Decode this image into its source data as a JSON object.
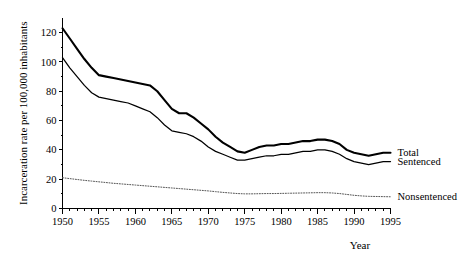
{
  "chart_data": {
    "type": "line",
    "title": "",
    "xlabel": "Year",
    "ylabel": "Incarceration rate per 100,000 inhabitants",
    "xlim": [
      1950,
      1995
    ],
    "ylim": [
      0,
      130
    ],
    "grid": false,
    "legend_position": "right-inline",
    "x_ticks_major": [
      1950,
      1955,
      1960,
      1965,
      1970,
      1975,
      1980,
      1985,
      1990,
      1995
    ],
    "x_tick_labels": [
      "1950",
      "1955",
      "1960",
      "1965",
      "1970",
      "1975",
      "1980",
      "1985",
      "1990",
      "1995"
    ],
    "x_ticks_minor_step": 1,
    "y_ticks": [
      0,
      20,
      40,
      60,
      80,
      100,
      120
    ],
    "y_tick_labels": [
      "0",
      "20",
      "40",
      "60",
      "80",
      "100",
      "120"
    ],
    "x": [
      1950,
      1951,
      1952,
      1953,
      1954,
      1955,
      1956,
      1957,
      1958,
      1959,
      1960,
      1961,
      1962,
      1963,
      1964,
      1965,
      1966,
      1967,
      1968,
      1969,
      1970,
      1971,
      1972,
      1973,
      1974,
      1975,
      1976,
      1977,
      1978,
      1979,
      1980,
      1981,
      1982,
      1983,
      1984,
      1985,
      1986,
      1987,
      1988,
      1989,
      1990,
      1991,
      1992,
      1993,
      1994,
      1995
    ],
    "series": [
      {
        "name": "Total",
        "label": "Total",
        "style": "solid-thick",
        "values": [
          123,
          116,
          109,
          102,
          96,
          91,
          90,
          89,
          88,
          87,
          86,
          85,
          84,
          80,
          74,
          68,
          65,
          65,
          62,
          58,
          54,
          49,
          45,
          42,
          39,
          38,
          40,
          42,
          43,
          43,
          44,
          44,
          45,
          46,
          46,
          47,
          47,
          46,
          44,
          40,
          38,
          37,
          36,
          37,
          38,
          38
        ]
      },
      {
        "name": "Sentenced",
        "label": "Sentenced",
        "style": "solid-thin",
        "values": [
          103,
          96,
          90,
          84,
          79,
          76,
          75,
          74,
          73,
          72,
          70,
          68,
          66,
          62,
          57,
          53,
          52,
          51,
          49,
          46,
          42,
          39,
          37,
          35,
          33,
          33,
          34,
          35,
          36,
          36,
          37,
          37,
          38,
          39,
          39,
          40,
          40,
          39,
          37,
          34,
          32,
          31,
          30,
          31,
          32,
          32
        ]
      },
      {
        "name": "Nonsentenced",
        "label": "Nonsentenced",
        "style": "dotted",
        "values": [
          21,
          20.4,
          19.8,
          19.2,
          18.7,
          18.2,
          17.7,
          17.2,
          16.8,
          16.4,
          16,
          15.6,
          15.2,
          14.8,
          14.4,
          14,
          13.6,
          13.2,
          12.8,
          12.4,
          12,
          11.5,
          11,
          10.6,
          10.2,
          10,
          10,
          10.1,
          10.2,
          10.2,
          10.3,
          10.4,
          10.5,
          10.6,
          10.7,
          10.8,
          10.8,
          10.6,
          10.2,
          9.6,
          9,
          8.6,
          8.3,
          8.2,
          8.1,
          8
        ]
      }
    ]
  }
}
